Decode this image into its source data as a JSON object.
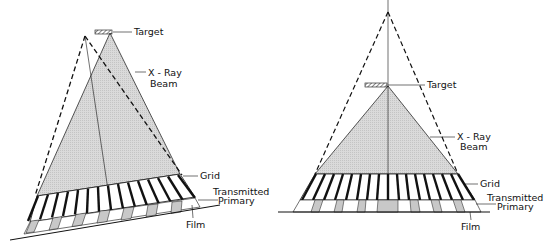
{
  "figures": [
    {
      "id": "tilted-grid",
      "labels": {
        "target": "Target",
        "xray_beam_line1": "X - Ray",
        "xray_beam_line2": "Beam",
        "grid": "Grid",
        "transmitted_line1": "Transmitted",
        "transmitted_line2": "Primary",
        "film": "Film"
      }
    },
    {
      "id": "off-distance-grid",
      "labels": {
        "target": "Target",
        "xray_beam_line1": "X - Ray",
        "xray_beam_line2": "Beam",
        "grid": "Grid",
        "transmitted_line1": "Transmitted",
        "transmitted_line2": "Primary",
        "film": "Film"
      }
    }
  ],
  "colors": {
    "line": "#111111",
    "beam_fill": "#d9d9d9",
    "transmitted_fill": "#c8c8c8"
  }
}
